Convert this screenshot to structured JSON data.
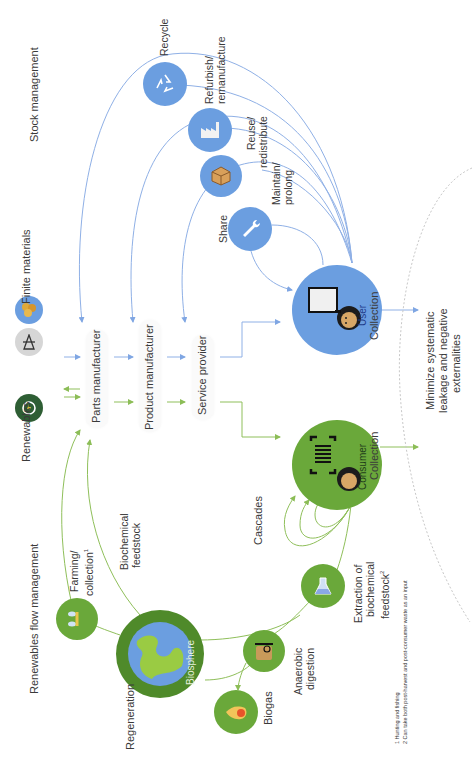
{
  "diagram": {
    "title_left_top": "Stock management",
    "title_left_bottom": "Renewables flow management",
    "inputs": {
      "finite": {
        "label": "Finite materials",
        "icons": [
          "minerals-icon",
          "oil-rig-icon"
        ]
      },
      "renewables": {
        "label": "Renewables",
        "icon": "renewable-energy-icon"
      }
    },
    "value_chain": [
      {
        "label": "Parts manufacturer"
      },
      {
        "label": "Product manufacturer"
      },
      {
        "label": "Service provider"
      }
    ],
    "technical_cycle": {
      "end_node": {
        "label": "User",
        "icon": "user-with-screen-icon"
      },
      "loops": [
        {
          "label": "Recycle",
          "icon": "recycle-icon"
        },
        {
          "label": "Refurbish/\nremanufacture",
          "line1": "Refurbish/",
          "line2": "remanufacture",
          "icon": "factory-icon"
        },
        {
          "label": "Reuse/ redistribute",
          "line1": "Reuse/",
          "line2": "redistribute",
          "icon": "box-icon"
        },
        {
          "label": "Maintain/ prolong",
          "line1": "Maintain/",
          "line2": "prolong",
          "icon": "wrench-icon"
        }
      ],
      "share_label": "Share",
      "collection_label": "Collection"
    },
    "biological_cycle": {
      "end_node": {
        "label": "Consumer",
        "icon": "consumer-barcode-icon"
      },
      "biosphere_label": "Biosphere",
      "farming": {
        "line1": "Farming/",
        "line2": "collection",
        "superscript": "1",
        "icon": "wheat-fish-icon"
      },
      "biochemical_feedstock": {
        "line1": "Biochemical",
        "line2": "feedstock"
      },
      "regeneration_label": "Regeneration",
      "biogas": {
        "label": "Biogas",
        "icon": "flame-icon"
      },
      "anaerobic": {
        "line1": "Anaerobic",
        "line2": "digestion",
        "icon": "digester-icon"
      },
      "extraction": {
        "line1": "Extraction of",
        "line2": "biochemical",
        "line3": "feedstock",
        "superscript": "2",
        "icon": "flask-icon"
      },
      "cascades_label": "Cascades",
      "collection_label": "Collection"
    },
    "leakage": {
      "line1": "Minimize systematic",
      "line2": "leakage and negative",
      "line3": "externalities"
    },
    "footnotes": [
      "1 Hunting and fishing",
      "2 Can take both post-harvest and post-consumer waste as an input"
    ]
  },
  "colors": {
    "blue": "#6b9ee0",
    "blue_line": "#8fb0e6",
    "green": "#6aa83a",
    "green_dark": "#4f8a2a",
    "green_line": "#8fbf5a",
    "renewable_dark": "#2e5e34",
    "gray": "#d6d6d6"
  }
}
